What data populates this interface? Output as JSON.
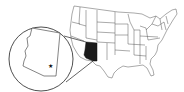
{
  "map": {
    "type": "locator-map",
    "region": "United States",
    "highlighted_state": "Arizona",
    "inset": {
      "shape": "circle",
      "content": "Arizona outline",
      "marker": "star"
    },
    "colors": {
      "background": "#ffffff",
      "state_fill": "#ffffff",
      "state_stroke": "#444444",
      "highlight_fill": "#1a1a1a",
      "inset_stroke": "#222222",
      "marker": "#111111"
    }
  }
}
